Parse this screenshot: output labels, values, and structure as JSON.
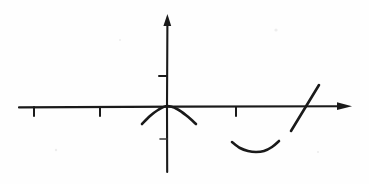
{
  "figure": {
    "title": "Hand-drawn Cartesian coordinate graph",
    "description": "A hand-drawn x-y axis diagram with an arrowhead on the positive x-axis and positive y-axis, four tick marks, a downward-opening arc centered at the origin, a separate upward-opening arc below the positive x-axis, and a straight line segment with positive slope crossing the positive x-axis.",
    "background_color": "#fefefe",
    "ink_color": "#1a1a1a",
    "width": 369,
    "height": 184
  },
  "chart_data": {
    "type": "line",
    "title": "Hand-drawn Cartesian coordinate graph",
    "xlabel": "",
    "ylabel": "",
    "grid": false,
    "legend": false,
    "origin_px": {
      "x": 166,
      "y": 107
    },
    "axes": {
      "x_axis": {
        "name": "x-axis",
        "start_px": {
          "x": 19,
          "y": 107
        },
        "end_px": {
          "x": 352,
          "y": 106
        },
        "arrowhead": "right",
        "arrow_tip_px": {
          "x": 352,
          "y": 106
        }
      },
      "y_axis": {
        "name": "y-axis",
        "start_px": {
          "x": 167,
          "y": 172
        },
        "end_px": {
          "x": 167,
          "y": 16
        },
        "arrowhead": "up",
        "arrow_tip_px": {
          "x": 167,
          "y": 16
        }
      }
    },
    "ticks": [
      {
        "axis": "x",
        "label": "",
        "position_px": {
          "x": 34,
          "y": 107
        },
        "direction": "down",
        "length_px": 9,
        "emphasis": "normal"
      },
      {
        "axis": "x",
        "label": "",
        "position_px": {
          "x": 100,
          "y": 107
        },
        "direction": "down",
        "length_px": 9,
        "emphasis": "normal"
      },
      {
        "axis": "x",
        "label": "",
        "position_px": {
          "x": 236,
          "y": 107
        },
        "direction": "down",
        "length_px": 9,
        "emphasis": "normal"
      },
      {
        "axis": "y",
        "label": "",
        "position_px": {
          "x": 167,
          "y": 76
        },
        "direction": "left",
        "length_px": 8,
        "emphasis": "normal"
      },
      {
        "axis": "y",
        "label": "",
        "position_px": {
          "x": 167,
          "y": 139
        },
        "direction": "left",
        "length_px": 7,
        "emphasis": "faint"
      }
    ],
    "curves": [
      {
        "name": "arc-at-origin",
        "shape": "downward-opening arc (concave down)",
        "vertex_px": {
          "x": 167,
          "y": 106
        },
        "left_end_px": {
          "x": 142,
          "y": 124
        },
        "right_end_px": {
          "x": 196,
          "y": 124
        },
        "points_px": [
          {
            "x": 142,
            "y": 124
          },
          {
            "x": 150,
            "y": 116
          },
          {
            "x": 158,
            "y": 110
          },
          {
            "x": 167,
            "y": 106
          },
          {
            "x": 177,
            "y": 109
          },
          {
            "x": 187,
            "y": 116
          },
          {
            "x": 196,
            "y": 124
          }
        ]
      },
      {
        "name": "arc-below-axis",
        "shape": "upward-opening arc (concave up)",
        "vertex_px": {
          "x": 255,
          "y": 152
        },
        "left_end_px": {
          "x": 232,
          "y": 142
        },
        "right_end_px": {
          "x": 279,
          "y": 141
        },
        "points_px": [
          {
            "x": 232,
            "y": 142
          },
          {
            "x": 240,
            "y": 148
          },
          {
            "x": 248,
            "y": 151
          },
          {
            "x": 256,
            "y": 152
          },
          {
            "x": 264,
            "y": 151
          },
          {
            "x": 272,
            "y": 147
          },
          {
            "x": 279,
            "y": 141
          }
        ]
      }
    ],
    "segments": [
      {
        "name": "diagonal-line-segment",
        "shape": "straight line, positive slope",
        "start_px": {
          "x": 291,
          "y": 131
        },
        "end_px": {
          "x": 319,
          "y": 85
        },
        "crosses_x_axis_at_px": {
          "x": 304,
          "y": 107
        },
        "slope_px": -1.64
      }
    ],
    "specks": [
      {
        "x": 276,
        "y": 30,
        "r": 1.6
      },
      {
        "x": 56,
        "y": 150,
        "r": 1.2
      },
      {
        "x": 318,
        "y": 152,
        "r": 1.1
      },
      {
        "x": 120,
        "y": 40,
        "r": 1.0
      }
    ]
  }
}
